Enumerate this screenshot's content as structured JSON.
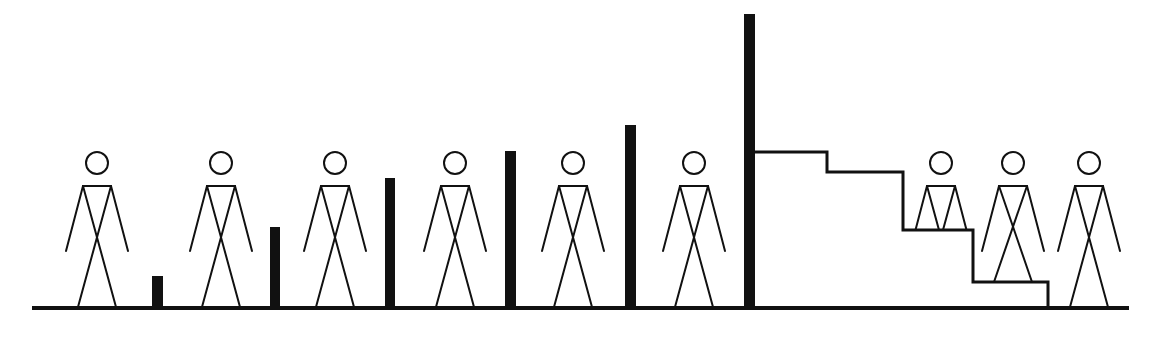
{
  "diagram": {
    "colors": {
      "ink": "#111111",
      "background": "#ffffff"
    },
    "ground": {
      "x1": 32,
      "x2": 1129,
      "y": 308,
      "thickness": 4
    },
    "bars": [
      {
        "x": 152,
        "width": 11,
        "top": 276
      },
      {
        "x": 270,
        "width": 10,
        "top": 227
      },
      {
        "x": 385,
        "width": 10,
        "top": 178
      },
      {
        "x": 505,
        "width": 11,
        "top": 151
      },
      {
        "x": 625,
        "width": 11,
        "top": 125
      },
      {
        "x": 744,
        "width": 11,
        "top": 14
      }
    ],
    "staircase": {
      "points": [
        [
          755,
          152
        ],
        [
          827,
          152
        ],
        [
          827,
          172
        ],
        [
          903,
          172
        ],
        [
          903,
          230
        ],
        [
          973,
          230
        ],
        [
          973,
          282
        ],
        [
          1048,
          282
        ],
        [
          1048,
          308
        ]
      ],
      "thickness": 3
    },
    "figures": [
      {
        "cx": 97,
        "ground": 307,
        "clip": null
      },
      {
        "cx": 221,
        "ground": 307,
        "clip": null
      },
      {
        "cx": 335,
        "ground": 307,
        "clip": null
      },
      {
        "cx": 455,
        "ground": 307,
        "clip": null
      },
      {
        "cx": 573,
        "ground": 307,
        "clip": null
      },
      {
        "cx": 694,
        "ground": 307,
        "clip": null
      },
      {
        "cx": 941,
        "ground": 307,
        "clip": 229
      },
      {
        "cx": 1013,
        "ground": 282,
        "clip": null
      },
      {
        "cx": 1089,
        "ground": 307,
        "clip": null
      }
    ]
  }
}
